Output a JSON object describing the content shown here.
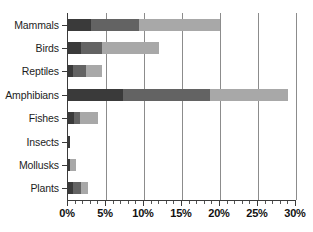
{
  "chart_data": {
    "type": "bar",
    "orientation": "horizontal",
    "stacked": true,
    "title": "",
    "subtitle": "",
    "xlabel": "",
    "ylabel": "",
    "xlim": [
      0,
      30
    ],
    "xtick_values": [
      0,
      5,
      10,
      15,
      20,
      25,
      30
    ],
    "xtick_labels": [
      "0%",
      "5%",
      "10%",
      "15%",
      "20%",
      "25%",
      "30%"
    ],
    "minor_tick_step": 1,
    "grid": "vertical",
    "legend": "none",
    "categories": [
      "Mammals",
      "Birds",
      "Reptiles",
      "Amphibians",
      "Fishes",
      "Insects",
      "Mollusks",
      "Plants"
    ],
    "series": [
      {
        "name": "series-1",
        "color": "#3a3a3a",
        "values": [
          3.0,
          1.7,
          0.7,
          7.2,
          0.8,
          0.2,
          0.3,
          0.7
        ]
      },
      {
        "name": "series-2",
        "color": "#636363",
        "values": [
          6.3,
          2.8,
          1.7,
          11.5,
          0.8,
          0.0,
          0.0,
          1.0
        ]
      },
      {
        "name": "series-3",
        "color": "#a8a8a8",
        "values": [
          10.7,
          7.5,
          2.1,
          10.3,
          2.4,
          0.0,
          0.7,
          0.9
        ]
      }
    ],
    "totals": [
      20.0,
      12.0,
      4.5,
      29.0,
      4.0,
      0.2,
      1.0,
      2.6
    ]
  },
  "axis": {
    "x_labels": [
      "0%",
      "5%",
      "10%",
      "15%",
      "20%",
      "25%",
      "30%"
    ],
    "y_labels": [
      "Mammals",
      "Birds",
      "Reptiles",
      "Amphibians",
      "Fishes",
      "Insects",
      "Mollusks",
      "Plants"
    ]
  },
  "colors": {
    "segment_dark": "#3a3a3a",
    "segment_medium": "#636363",
    "segment_light": "#a8a8a8",
    "gridline": "#8c8c8c",
    "axis": "#3b3b3b",
    "background": "#ffffff",
    "text": "#111111"
  }
}
